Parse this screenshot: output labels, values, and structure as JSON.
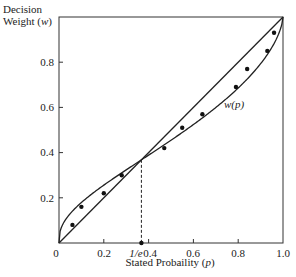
{
  "chart_data": {
    "type": "line",
    "title": "",
    "xlabel": "Stated Probaility (p)",
    "ylabel": "Decision Weight (w)",
    "xlim": [
      0,
      1.0
    ],
    "ylim": [
      0,
      1.0
    ],
    "x_ticks": [
      "0",
      "0.2",
      "1/e",
      "0.4",
      "0.6",
      "0.8",
      "1.0"
    ],
    "y_ticks": [
      "0.2",
      "0.4",
      "0.6",
      "0.8"
    ],
    "grid": false,
    "series": [
      {
        "name": "diagonal (w = p)",
        "kind": "line",
        "x": [
          0,
          1.0
        ],
        "y": [
          0,
          1.0
        ]
      },
      {
        "name": "w(p)",
        "kind": "curve",
        "formula": "w = exp(-(-ln p)^0.65)",
        "x": [
          0,
          0.05,
          0.1,
          0.2,
          0.3,
          0.368,
          0.4,
          0.5,
          0.6,
          0.7,
          0.8,
          0.9,
          0.95,
          1.0
        ],
        "y": [
          0,
          0.12,
          0.19,
          0.28,
          0.34,
          0.368,
          0.38,
          0.44,
          0.5,
          0.58,
          0.67,
          0.79,
          0.87,
          1.0
        ]
      },
      {
        "name": "observed",
        "kind": "scatter",
        "x": [
          0.06,
          0.1,
          0.2,
          0.28,
          0.47,
          0.55,
          0.64,
          0.79,
          0.84,
          0.93,
          0.96
        ],
        "y": [
          0.08,
          0.16,
          0.22,
          0.3,
          0.42,
          0.51,
          0.57,
          0.69,
          0.77,
          0.85,
          0.93
        ]
      }
    ],
    "annotations": [
      {
        "text": "w(p)",
        "x": 0.75,
        "y": 0.63
      },
      {
        "text": "1/e",
        "type": "dashed-vertical-line",
        "x": 0.368,
        "y_from": 0,
        "y_to": 0.368
      }
    ]
  },
  "labels": {
    "y_line1": "Decision",
    "y_line2_prefix": "Weight (",
    "y_var": "w",
    "y_suffix": ")",
    "x_prefix": "Stated Probaility (",
    "x_var": "p",
    "x_suffix": ")",
    "curve": "w(p)",
    "tick_x_0": "0",
    "tick_x_02": "0.2",
    "tick_x_inv_e": "1/e",
    "tick_x_04": "0.4",
    "tick_x_06": "0.6",
    "tick_x_08": "0.8",
    "tick_x_10": "1.0",
    "tick_y_02": "0.2",
    "tick_y_04": "0.4",
    "tick_y_06": "0.6",
    "tick_y_08": "0.8"
  }
}
